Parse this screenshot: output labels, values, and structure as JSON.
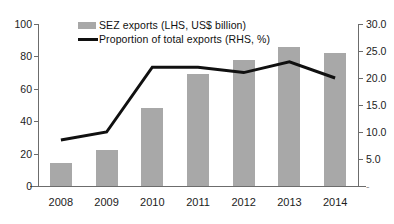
{
  "chart_data": {
    "type": "bar",
    "title": "",
    "xlabel": "",
    "categories": [
      "2008",
      "2009",
      "2010",
      "2011",
      "2012",
      "2013",
      "2014"
    ],
    "grid": false,
    "legend_position": "top-center",
    "series": [
      {
        "name": "SEZ exports (LHS, US$ billion)",
        "type": "bar",
        "axis": "left",
        "color": "#a8a8a8",
        "values": [
          14,
          22,
          48,
          69,
          78,
          86,
          82
        ]
      },
      {
        "name": "Proportion of total exports (RHS, %)",
        "type": "line",
        "axis": "right",
        "color": "#101010",
        "values": [
          8.5,
          10.0,
          22.0,
          22.0,
          21.0,
          23.0,
          20.0
        ]
      }
    ],
    "left_axis": {
      "label": "SEZ exports (LHS, US$ billion)",
      "ticks": [
        "0",
        "20",
        "40",
        "60",
        "80",
        "100"
      ],
      "ylim": [
        0,
        100
      ]
    },
    "right_axis": {
      "label": "Proportion of total exports (RHS, %)",
      "ticks": [
        "-",
        "5.0",
        "10.0",
        "15.0",
        "20.0",
        "25.0",
        "30.0"
      ],
      "ylim": [
        0,
        30
      ]
    }
  },
  "legend": {
    "bars_label": "SEZ exports (LHS, US$ billion)",
    "line_label": "Proportion of total exports (RHS, %)"
  }
}
